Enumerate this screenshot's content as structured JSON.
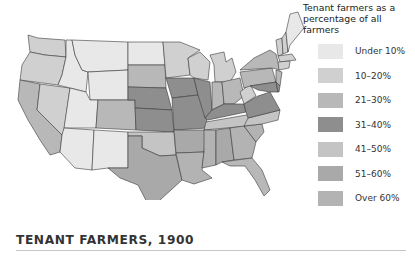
{
  "legend": {
    "title_line1": "Tenant farmers as a",
    "title_line2": "percentage of all farmers",
    "items": [
      {
        "label": "Under 10%",
        "color": "#e8e8e8"
      },
      {
        "label": "10–20%",
        "color": "#d0d0d0"
      },
      {
        "label": "21–30%",
        "color": "#b8b8b8"
      },
      {
        "label": "31–40%",
        "color": "#8e8e8e"
      },
      {
        "label": "41–50%",
        "color": "#c4c4c4"
      },
      {
        "label": "51–60%",
        "color": "#a9a9a9"
      },
      {
        "label": "Over 60%",
        "color": "#b3b3b3"
      }
    ]
  },
  "map": {
    "title": "TENANT FARMERS, 1900",
    "states": {
      "WA": "10–20%",
      "OR": "10–20%",
      "CA": "21–30%",
      "NV": "10–20%",
      "ID": "Under 10%",
      "MT": "Under 10%",
      "WY": "Under 10%",
      "UT": "Under 10%",
      "AZ": "Under 10%",
      "NM": "Under 10%",
      "CO": "21–30%",
      "ND": "Under 10%",
      "SD": "21–30%",
      "NE": "31–40%",
      "KS": "31–40%",
      "OK": "41–50%",
      "TX": "51–60%",
      "MN": "10–20%",
      "IA": "31–40%",
      "MO": "31–40%",
      "AR": "51–60%",
      "LA": "Over 60%",
      "WI": "10–20%",
      "IL": "31–40%",
      "MI": "10–20%",
      "IN": "21–30%",
      "OH": "21–30%",
      "KY": "31–40%",
      "TN": "41–50%",
      "MS": "Over 60%",
      "AL": "51–60%",
      "GA": "Over 60%",
      "FL": "21–30%",
      "SC": "Over 60%",
      "NC": "41–50%",
      "VA": "31–40%",
      "WV": "10–20%",
      "PA": "21–30%",
      "NY": "21–30%",
      "VT": "10–20%",
      "NH": "10–20%",
      "ME": "Under 10%",
      "MA": "10–20%",
      "CT": "10–20%",
      "NJ": "21–30%",
      "DE": "31–40%",
      "MD": "31–40%"
    }
  }
}
